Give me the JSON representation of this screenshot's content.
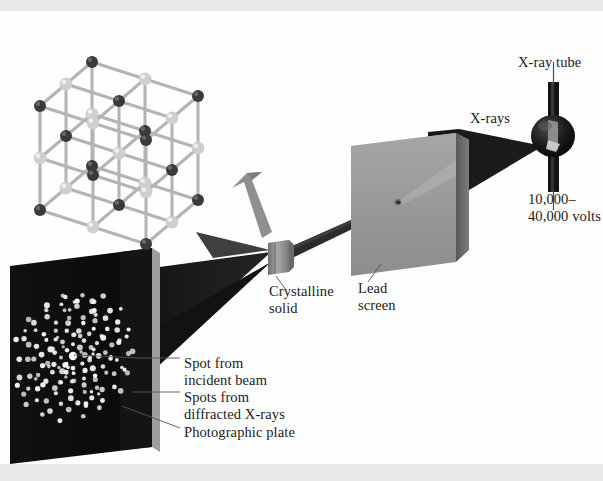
{
  "figure": {
    "background_color": "#fefefe",
    "band_color": "#e9e9e9",
    "width": 603,
    "height": 481
  },
  "labels": {
    "xray_tube": "X-ray tube",
    "xrays": "X-rays",
    "voltage": "10,000–\n40,000 volts",
    "lead_screen": "Lead\nscreen",
    "crystalline_solid": "Crystalline\nsolid",
    "spot_incident": "Spot from\nincident beam",
    "spots_diffracted": "Spots from\ndiffracted X-rays",
    "photographic_plate": "Photographic plate"
  },
  "components": {
    "xray_tube": {
      "name": "x-ray-tube",
      "shape": "glass bulb with vertical electrode stems",
      "color": "#131313",
      "center_x": 553,
      "center_y": 136,
      "bulb_radius": 21
    },
    "lead_screen": {
      "name": "lead-screen",
      "shape": "rectangular slab with central pinhole",
      "face_color": "#9a9a9a",
      "edge_color": "#6d6d6d",
      "top_color": "#c3c3c3",
      "pinhole_x": 398,
      "pinhole_y": 203
    },
    "crystal": {
      "name": "crystalline-solid-cube",
      "shape": "small cube mounted in beam path",
      "color": "#8e8e8e",
      "center_x": 278,
      "center_y": 257,
      "size": 20
    },
    "photographic_plate": {
      "name": "photographic-plate",
      "shape": "dark plate with Laue diffraction spots",
      "face_color": "#0d0d0d",
      "edge_color": "#f2f2f2",
      "spot_color": "#f6f6f6"
    },
    "crystal_lattice": {
      "name": "crystal-lattice-model",
      "shape": "3x3x3 ball-and-stick cubic lattice",
      "dark_atom_color": "#3a3a3a",
      "light_atom_color": "#cfcfcf",
      "bond_color": "#b4b4b4",
      "grid": 3
    },
    "callout_arrow": {
      "name": "magnify-arrow",
      "color": "#8d8d8d",
      "from": "crystal",
      "to": "lattice-model"
    }
  },
  "beams": {
    "primary_xrays": {
      "name": "primary-xray-beam",
      "color": "#1c1c1c",
      "description": "wide dark fan from tube to lead screen"
    },
    "collimated": {
      "name": "collimated-beam",
      "color": "#2a2a2a",
      "description": "narrow beam from pinhole to crystal"
    },
    "diffracted_fan": {
      "name": "diffracted-beam-fan",
      "color": "#1a1a1a",
      "description": "dark triangular fan from crystal to photographic plate"
    }
  },
  "chart_data": {
    "type": "scatter",
    "xlabel": "",
    "ylabel": "",
    "center_spot": {
      "x": 0,
      "y": 0,
      "label": "incident beam spot",
      "size": 4.2
    },
    "rings": [
      {
        "radius": 14,
        "count": 8,
        "phase": 0
      },
      {
        "radius": 24,
        "count": 10,
        "phase": 18
      },
      {
        "radius": 33,
        "count": 13,
        "phase": 7
      },
      {
        "radius": 42,
        "count": 15,
        "phase": 24
      },
      {
        "radius": 51,
        "count": 17,
        "phase": 11
      },
      {
        "radius": 60,
        "count": 19,
        "phase": 30
      },
      {
        "radius": 69,
        "count": 20,
        "phase": 5
      },
      {
        "radius": 78,
        "count": 18,
        "phase": 21
      }
    ],
    "spot_size": 2.3,
    "note": "spots arranged in quasi-symmetric radial pattern around bright central spot"
  }
}
